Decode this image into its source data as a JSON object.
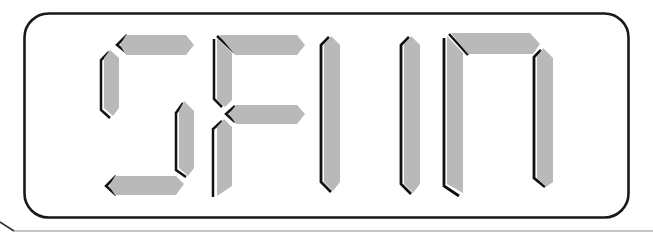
{
  "display": {
    "text": "SFIIN",
    "characters": [
      {
        "char": "S",
        "segments": [
          "top",
          "upper-left",
          "lower-right",
          "bottom"
        ]
      },
      {
        "char": "F",
        "segments": [
          "top",
          "upper-left",
          "middle",
          "lower-left"
        ]
      },
      {
        "char": "I",
        "segments": [
          "full-vertical"
        ]
      },
      {
        "char": "I",
        "segments": [
          "full-vertical"
        ]
      },
      {
        "char": "N",
        "segments": [
          "left-vertical",
          "top",
          "right-vertical"
        ]
      }
    ],
    "colors": {
      "background": "#ffffff",
      "frame": "#1a1a1a",
      "segment_fill": "#b9b9b9",
      "segment_shadow": "#111111",
      "segment_highlight": "#ffffff",
      "outer_frame": "#555555"
    }
  }
}
